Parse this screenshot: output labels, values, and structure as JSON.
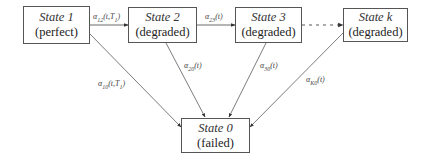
{
  "diagram": {
    "type": "state-transition",
    "nodes": [
      {
        "id": "s1",
        "name": "State 1",
        "condition": "(perfect)"
      },
      {
        "id": "s2",
        "name": "State 2",
        "condition": "(degraded)"
      },
      {
        "id": "s3",
        "name": "State 3",
        "condition": "(degraded)"
      },
      {
        "id": "sk",
        "name": "State k",
        "condition": "(degraded)"
      },
      {
        "id": "s0",
        "name": "State 0",
        "condition": "(failed)"
      }
    ],
    "edges": [
      {
        "from": "s1",
        "to": "s2",
        "label_base": "α",
        "label_sub": "12",
        "label_arg": "(t,T",
        "label_arg_sub": "1",
        "label_close": ")"
      },
      {
        "from": "s2",
        "to": "s3",
        "label_base": "α",
        "label_sub": "23",
        "label_arg": "(t)"
      },
      {
        "from": "s3",
        "to": "sk",
        "style": "dotted",
        "label_base": "",
        "label_sub": "",
        "label_arg": ""
      },
      {
        "from": "s1",
        "to": "s0",
        "label_base": "α",
        "label_sub": "10",
        "label_arg": "(t,T",
        "label_arg_sub": "1",
        "label_close": ")"
      },
      {
        "from": "s2",
        "to": "s0",
        "label_base": "α",
        "label_sub": "20",
        "label_arg": "(t)"
      },
      {
        "from": "s3",
        "to": "s0",
        "label_base": "α",
        "label_sub": "30",
        "label_arg": "(t)"
      },
      {
        "from": "sk",
        "to": "s0",
        "label_base": "α",
        "label_sub": "K0",
        "label_arg": "(t)"
      }
    ]
  }
}
